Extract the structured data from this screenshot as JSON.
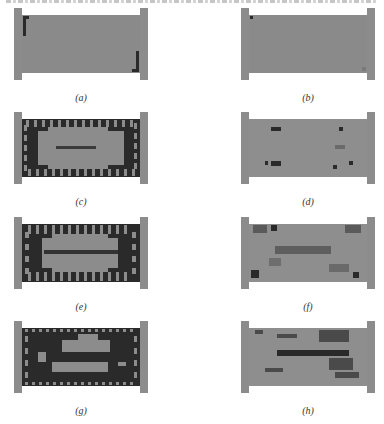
{
  "figure": {
    "top_text_cutoff": "",
    "colors": {
      "material_light": "#8c8c8c",
      "material_dark": "#2a2a2a",
      "background": "#ffffff"
    },
    "panels": [
      {
        "id": "a",
        "label": "(a)",
        "x": 14,
        "y": 8,
        "pattern": "nearly-uniform",
        "dark_regions": [
          "top-left-corner-L",
          "bottom-right-corner-L"
        ]
      },
      {
        "id": "b",
        "label": "(b)",
        "x": 241,
        "y": 8,
        "pattern": "uniform",
        "dark_regions": [
          "top-left-dot"
        ]
      },
      {
        "id": "c",
        "label": "(c)",
        "x": 14,
        "y": 112,
        "pattern": "dark-checkerboard-border-light-center",
        "dark_regions": [
          "frame",
          "center-bar"
        ]
      },
      {
        "id": "d",
        "label": "(d)",
        "x": 241,
        "y": 112,
        "pattern": "light-with-scattered-dark-spots",
        "dark_regions": [
          "upper-left-spot",
          "lower-left-spot",
          "right-spots"
        ]
      },
      {
        "id": "e",
        "label": "(e)",
        "x": 14,
        "y": 217,
        "pattern": "dark-striped-border-light-center",
        "dark_regions": [
          "frame",
          "center-bar"
        ]
      },
      {
        "id": "f",
        "label": "(f)",
        "x": 241,
        "y": 217,
        "pattern": "light-with-faint-diagonals",
        "dark_regions": [
          "corners",
          "center-band"
        ]
      },
      {
        "id": "g",
        "label": "(g)",
        "x": 14,
        "y": 321,
        "pattern": "dark-dotted-border-two-light-bands",
        "dark_regions": [
          "frame",
          "middle-band"
        ]
      },
      {
        "id": "h",
        "label": "(h)",
        "x": 241,
        "y": 321,
        "pattern": "light-with-dark-horizontal-bands",
        "dark_regions": [
          "upper-band",
          "center-band",
          "right-diagonals"
        ]
      }
    ]
  }
}
